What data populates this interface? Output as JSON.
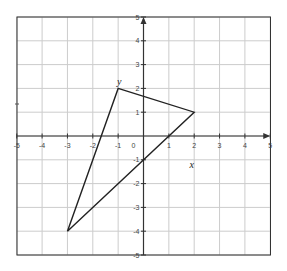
{
  "chart_data": {
    "type": "line",
    "title": "",
    "xlabel": "x",
    "ylabel": "y",
    "xlim": [
      -5,
      5
    ],
    "ylim": [
      -5,
      5
    ],
    "grid": true,
    "x_ticks": [
      -5,
      -4,
      -3,
      -2,
      -1,
      0,
      1,
      2,
      3,
      4,
      5
    ],
    "y_ticks": [
      -5,
      -4,
      -3,
      -2,
      -1,
      1,
      2,
      3,
      4,
      5
    ],
    "x_tick_labels": [
      "-5",
      "-4",
      "-3",
      "-2",
      "-1",
      "0",
      "1",
      "2",
      "3",
      "4",
      "5"
    ],
    "y_tick_labels": [
      "-5",
      "-4",
      "-3",
      "-2",
      "-1",
      "1",
      "2",
      "3",
      "4",
      "5"
    ],
    "series": [
      {
        "name": "triangle",
        "shape": "polygon",
        "points": [
          [
            -1,
            2
          ],
          [
            2,
            1
          ],
          [
            -3,
            -4
          ]
        ]
      }
    ],
    "annotations": [
      {
        "text": "y",
        "near": [
          -1,
          2
        ],
        "role": "vertex/axis label"
      },
      {
        "text": "x",
        "near": [
          1.9,
          -0.8
        ],
        "role": "axis label"
      }
    ],
    "legend": null
  },
  "labels": {
    "x_axis": "x",
    "y_axis": "y",
    "origin": "0"
  },
  "colors": {
    "grid": "#cccccc",
    "border": "#333333",
    "axis": "#333333",
    "triangle": "#222222"
  }
}
